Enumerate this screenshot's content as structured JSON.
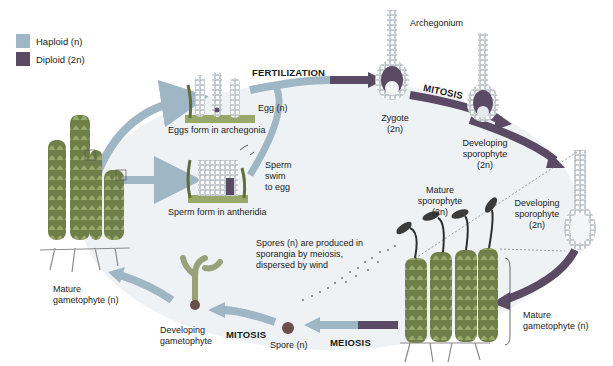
{
  "colors": {
    "haploid": "#9fb6c4",
    "diploid": "#5b4a63",
    "background_ellipse": "#eef2f5",
    "plant": "#7f8f56"
  },
  "legend": {
    "items": [
      {
        "label": "Haploid (n)",
        "color": "#9fb6c4"
      },
      {
        "label": "Diploid (2n)",
        "color": "#5b4a63"
      }
    ]
  },
  "processes": {
    "fertilization": "FERTILIZATION",
    "mitosis_top": "MITOSIS",
    "meiosis": "MEIOSIS",
    "mitosis_bottom": "MITOSIS"
  },
  "labels": {
    "archegonium": "Archegonium",
    "egg": "Egg (n)",
    "eggs_form": "Eggs form in archegonia",
    "sperm_swim_1": "Sperm",
    "sperm_swim_2": "swim",
    "sperm_swim_3": "to egg",
    "sperm_form": "Sperm form in antheridia",
    "zygote_1": "Zygote",
    "zygote_2": "(2n)",
    "dev_sporophyte_a_1": "Developing",
    "dev_sporophyte_a_2": "sporophyte",
    "dev_sporophyte_a_3": "(2n)",
    "dev_sporophyte_b_1": "Developing",
    "dev_sporophyte_b_2": "sporophyte",
    "dev_sporophyte_b_3": "(2n)",
    "mature_sporophyte_1": "Mature",
    "mature_sporophyte_2": "sporophyte",
    "mature_sporophyte_3": "(2n)",
    "spores_1": "Spores (n) are produced in",
    "spores_2": "sporangia by meiosis,",
    "spores_3": "dispersed by wind",
    "mature_gametophyte_right_1": "Mature",
    "mature_gametophyte_right_2": "gametophyte (n)",
    "mature_gametophyte_left_1": "Mature",
    "mature_gametophyte_left_2": "gametophyte (n)",
    "dev_gametophyte_1": "Developing",
    "dev_gametophyte_2": "gametophyte",
    "spore": "Spore (n)"
  }
}
